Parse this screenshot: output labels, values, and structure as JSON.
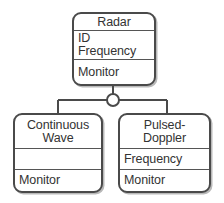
{
  "diagram": {
    "type": "uml-class-diagram",
    "notation": "generalization-with-circle-junction",
    "background_color": "#ffffff",
    "line_color": "#4a4a4a",
    "text_color": "#333333"
  },
  "classes": {
    "radar": {
      "name": "Radar",
      "attributes": [
        "ID",
        "Frequency"
      ],
      "operations": [
        "Monitor"
      ]
    },
    "continuous_wave": {
      "name_line1": "Continuous",
      "name_line2": "Wave",
      "attributes": [
        ""
      ],
      "operations": [
        "Monitor"
      ]
    },
    "pulsed_doppler": {
      "name_line1": "Pulsed-",
      "name_line2": "Doppler",
      "attributes": [
        "Frequency"
      ],
      "operations": [
        "Monitor"
      ]
    }
  },
  "connector": {
    "label": "generalization",
    "junction_shape": "circle"
  }
}
